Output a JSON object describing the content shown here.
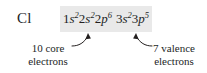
{
  "figure": {
    "element_symbol": "Cl",
    "highlight_color": "#e9e9e9",
    "text_color": "#231f1f",
    "background_color": "#ffffff"
  },
  "configuration": {
    "full_text": "1s22s22p6 3s23p5",
    "orbitals": [
      {
        "n": "1",
        "letter": "s",
        "electrons": "2"
      },
      {
        "n": "2",
        "letter": "s",
        "electrons": "2"
      },
      {
        "n": "2",
        "letter": "p",
        "electrons": "6"
      },
      {
        "n": "3",
        "letter": "s",
        "electrons": "2"
      },
      {
        "n": "3",
        "letter": "p",
        "electrons": "5"
      }
    ]
  },
  "annotations": {
    "core": {
      "line1": "10 core",
      "line2": "electrons",
      "count": "10",
      "type": "core"
    },
    "valence": {
      "line1": "7 valence",
      "line2": "electrons",
      "count": "7",
      "type": "valence"
    }
  }
}
